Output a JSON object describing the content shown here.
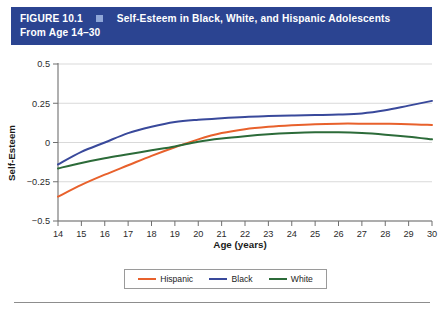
{
  "figure": {
    "number_label": "FIGURE 10.1",
    "marker_icon": "square-marker-icon",
    "title_line1": "Self-Esteem in Black, White, and Hispanic Adolescents",
    "title_line2": "From Age 14–30",
    "header_bg": "#2b4491",
    "header_text_color": "#ffffff"
  },
  "chart_data": {
    "type": "line",
    "title": "Self-Esteem in Black, White, and Hispanic Adolescents From Age 14–30",
    "xlabel": "Age (years)",
    "ylabel": "Self-Esteem",
    "x": [
      14,
      15,
      16,
      17,
      18,
      19,
      20,
      21,
      22,
      23,
      24,
      25,
      26,
      27,
      28,
      29,
      30
    ],
    "xtick_labels": [
      "14",
      "15",
      "16",
      "17",
      "18",
      "19",
      "20",
      "21",
      "22",
      "23",
      "24",
      "25",
      "26",
      "27",
      "28",
      "29",
      "30"
    ],
    "ytick_labels": [
      "0.5",
      "0.25",
      "0",
      "−0.25",
      "−0.5"
    ],
    "ytick_values": [
      0.5,
      0.25,
      0,
      -0.25,
      -0.5
    ],
    "xlim": [
      14,
      30
    ],
    "ylim": [
      -0.5,
      0.5
    ],
    "grid": "horizontal",
    "legend_position": "bottom",
    "series": [
      {
        "name": "Hispanic",
        "color": "#e8612c",
        "values": [
          -0.345,
          -0.27,
          -0.205,
          -0.145,
          -0.085,
          -0.03,
          0.02,
          0.06,
          0.085,
          0.1,
          0.11,
          0.117,
          0.12,
          0.12,
          0.119,
          0.117,
          0.112
        ]
      },
      {
        "name": "Black",
        "color": "#39499b",
        "values": [
          -0.14,
          -0.06,
          0.0,
          0.06,
          0.1,
          0.13,
          0.145,
          0.155,
          0.163,
          0.168,
          0.172,
          0.175,
          0.178,
          0.185,
          0.205,
          0.235,
          0.265
        ]
      },
      {
        "name": "White",
        "color": "#2c6b39",
        "values": [
          -0.165,
          -0.13,
          -0.1,
          -0.075,
          -0.05,
          -0.025,
          0.005,
          0.025,
          0.04,
          0.052,
          0.06,
          0.065,
          0.065,
          0.06,
          0.05,
          0.037,
          0.02
        ]
      }
    ]
  },
  "legend": {
    "items": [
      {
        "label": "Hispanic",
        "color": "#e8612c"
      },
      {
        "label": "Black",
        "color": "#39499b"
      },
      {
        "label": "White",
        "color": "#2c6b39"
      }
    ]
  }
}
